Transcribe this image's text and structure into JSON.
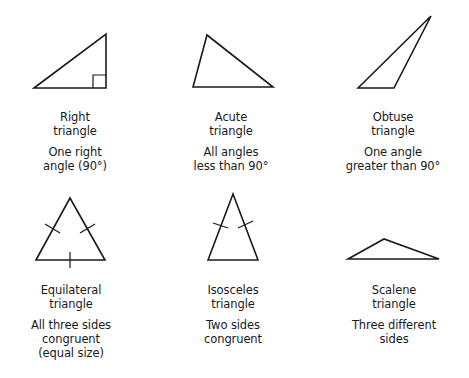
{
  "diagram": {
    "stroke_color": "#1a1a1a",
    "background": "#ffffff",
    "triangles": [
      {
        "id": "right",
        "name_lines": [
          "Right",
          "triangle"
        ],
        "desc_lines": [
          "One right",
          "angle (90°)"
        ],
        "points": [
          [
            34,
            88
          ],
          [
            106,
            34
          ],
          [
            106,
            88
          ]
        ],
        "marks": {
          "right_angle_box": {
            "x": 93,
            "y": 75,
            "size": 13
          }
        }
      },
      {
        "id": "acute",
        "name_lines": [
          "Acute",
          "triangle"
        ],
        "desc_lines": [
          "All angles",
          "less than 90°"
        ],
        "points": [
          [
            193,
            87
          ],
          [
            207,
            35
          ],
          [
            273,
            87
          ]
        ]
      },
      {
        "id": "obtuse",
        "name_lines": [
          "Obtuse",
          "triangle"
        ],
        "desc_lines": [
          "One angle",
          "greater than 90°"
        ],
        "points": [
          [
            358,
            88
          ],
          [
            431,
            16
          ],
          [
            394,
            88
          ]
        ]
      },
      {
        "id": "equilateral",
        "name_lines": [
          "Equilateral",
          "triangle"
        ],
        "desc_lines": [
          "All three sides",
          "congruent",
          "(equal size)"
        ],
        "points": [
          [
            36,
            260
          ],
          [
            70,
            198
          ],
          [
            105,
            260
          ]
        ],
        "marks": {
          "tick_marks": 3
        }
      },
      {
        "id": "isosceles",
        "name_lines": [
          "Isosceles",
          "triangle"
        ],
        "desc_lines": [
          "Two sides",
          "congruent"
        ],
        "points": [
          [
            208,
            260
          ],
          [
            233,
            194
          ],
          [
            258,
            260
          ]
        ],
        "marks": {
          "tick_marks": 2
        }
      },
      {
        "id": "scalene",
        "name_lines": [
          "Scalene",
          "triangle"
        ],
        "desc_lines": [
          "Three different",
          "sides"
        ],
        "points": [
          [
            348,
            259
          ],
          [
            384,
            239
          ],
          [
            439,
            259
          ]
        ]
      }
    ]
  }
}
